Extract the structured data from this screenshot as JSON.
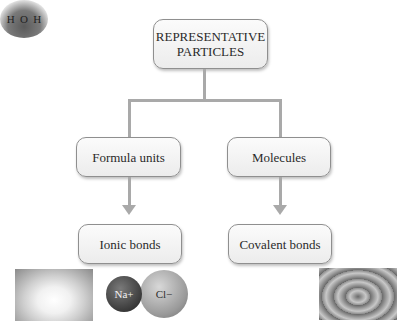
{
  "diagram": {
    "root": {
      "label_line1": "REPRESENTATIVE",
      "label_line2": "PARTICLES"
    },
    "level2": [
      {
        "label": "Formula units"
      },
      {
        "label": "Molecules"
      }
    ],
    "level3": [
      {
        "label": "Ionic bonds"
      },
      {
        "label": "Covalent bonds"
      }
    ],
    "images": {
      "salt": "salt-crystals-photo",
      "nacl_model": {
        "ion1": "Na+",
        "ion2": "Cl−"
      },
      "water_model": {
        "atom1": "H",
        "atom2": "O",
        "atom3": "H"
      },
      "water_drop": "water-drop-ripple-photo"
    },
    "colors": {
      "line": "#a9a9a9",
      "box_border": "#8f8f8f",
      "box_fill": "#f4f4f4",
      "text": "#2a2a2a"
    }
  }
}
